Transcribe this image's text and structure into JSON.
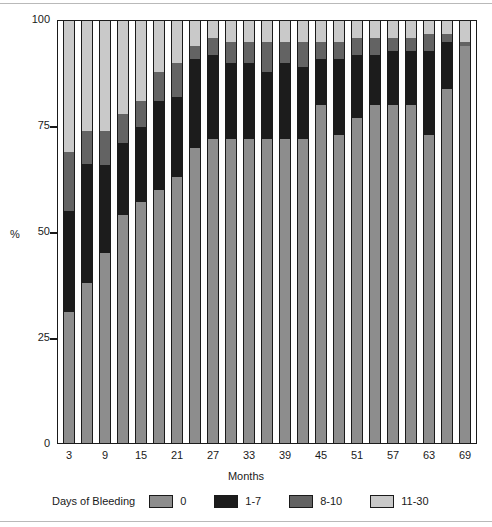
{
  "chart_data": {
    "type": "bar",
    "title": "",
    "subtitle": "",
    "stacked": true,
    "stack_total": 100,
    "xlabel": "Months",
    "ylabel": "%",
    "ylim": [
      0,
      100
    ],
    "yticks": [
      0,
      25,
      50,
      75,
      100
    ],
    "grid": false,
    "legend_position": "bottom",
    "legend_title": "Days of Bleeding",
    "categories": [
      3,
      6,
      9,
      12,
      15,
      18,
      21,
      24,
      27,
      30,
      33,
      36,
      39,
      42,
      45,
      48,
      51,
      54,
      57,
      60,
      63,
      66,
      69
    ],
    "xtick_labels": [
      "3",
      "9",
      "15",
      "21",
      "27",
      "33",
      "39",
      "45",
      "51",
      "57",
      "63",
      "69"
    ],
    "xtick_categories": [
      3,
      9,
      15,
      21,
      27,
      33,
      39,
      45,
      51,
      57,
      63,
      69
    ],
    "series": [
      {
        "name": "0",
        "color": "#8d8d8d",
        "values": [
          31,
          38,
          45,
          54,
          57,
          60,
          63,
          70,
          72,
          72,
          72,
          72,
          72,
          72,
          80,
          73,
          77,
          80,
          80,
          80,
          73,
          84,
          94
        ]
      },
      {
        "name": "1-7",
        "color": "#1c1c1c",
        "values": [
          24,
          28,
          21,
          17,
          18,
          21,
          19,
          21,
          20,
          18,
          18,
          16,
          18,
          17,
          11,
          18,
          15,
          12,
          13,
          13,
          20,
          11,
          0
        ]
      },
      {
        "name": "8-10",
        "color": "#636363",
        "values": [
          14,
          8,
          8,
          7,
          6,
          7,
          8,
          3,
          4,
          5,
          5,
          7,
          5,
          6,
          4,
          4,
          4,
          4,
          3,
          3,
          4,
          2,
          1
        ]
      },
      {
        "name": "11-30",
        "color": "#c9c9c9",
        "values": [
          31,
          26,
          26,
          22,
          19,
          12,
          10,
          6,
          4,
          5,
          5,
          5,
          5,
          5,
          5,
          5,
          4,
          4,
          4,
          4,
          3,
          3,
          5
        ]
      }
    ]
  },
  "axis": {
    "y_tick_labels": [
      "100",
      "75",
      "50",
      "25",
      "0"
    ],
    "y_axis_title": "%",
    "x_axis_title": "Months"
  },
  "legend": {
    "title": "Days of Bleeding",
    "items": [
      {
        "label": "0",
        "color": "#8d8d8d"
      },
      {
        "label": "1-7",
        "color": "#1c1c1c"
      },
      {
        "label": "8-10",
        "color": "#636363"
      },
      {
        "label": "11-30",
        "color": "#c9c9c9"
      }
    ]
  }
}
